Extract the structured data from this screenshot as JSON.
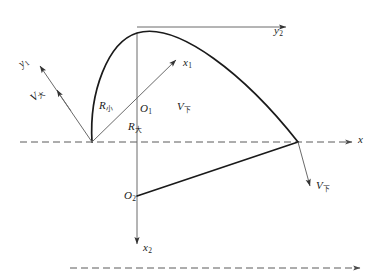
{
  "figure": {
    "background_color": "#ffffff",
    "line_color": "#1a1a1a",
    "dashed_color": "#555555",
    "thin_color": "#555555"
  },
  "labels": {
    "axis_x": "x",
    "axis_x1_base": "x",
    "axis_x1_sub": "1",
    "axis_x2_base": "x",
    "axis_x2_sub": "2",
    "axis_y1_base": "y",
    "axis_y1_sub": "1",
    "axis_y2_base": "y",
    "axis_y2_sub": "2",
    "origin1_base": "O",
    "origin1_sub": "1",
    "origin2_base": "O",
    "origin2_sub": "2",
    "radius_small_base": "R",
    "radius_small_sub": "小",
    "radius_large_base": "R",
    "radius_large_sub": "大",
    "velocity_big_base": "V",
    "velocity_big_sub": "大",
    "velocity_small_center_base": "V",
    "velocity_small_center_sub": "下",
    "velocity_small_right_base": "V",
    "velocity_small_right_sub": "下"
  },
  "geometry": {
    "apex": [
      137,
      33
    ],
    "origin1": [
      137,
      114
    ],
    "origin2": [
      137,
      196
    ],
    "left_point": [
      92,
      142
    ],
    "right_point": [
      298,
      142
    ],
    "baseline_y": 142,
    "bottom_dashed_y": 268,
    "x_axis_arrow_end": [
      352,
      142
    ],
    "x1_arrow_end": [
      178,
      58
    ],
    "x2_arrow_end": [
      137,
      250
    ],
    "y2_arrow_end": [
      288,
      27
    ],
    "y1_arrow_end": [
      38,
      64
    ],
    "vbig_arrow_end": [
      56,
      92
    ],
    "vsmall_arrow_end": [
      312,
      188
    ]
  }
}
